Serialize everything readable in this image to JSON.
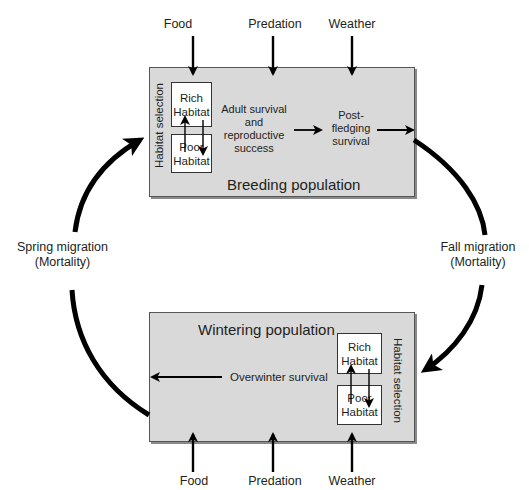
{
  "diagram": {
    "type": "annual-cycle flow diagram",
    "top_factors": [
      "Food",
      "Predation",
      "Weather"
    ],
    "bottom_factors": [
      "Food",
      "Predation",
      "Weather"
    ],
    "breeding": {
      "title": "Breeding population",
      "habitat_selection_label": "Habitat selection",
      "rich_habitat": [
        "Rich",
        "Habitat"
      ],
      "poor_habitat": [
        "Poor",
        "Habitat"
      ],
      "adult_survival": [
        "Adult survival",
        "and",
        "reproductive",
        "success"
      ],
      "post_fledging": [
        "Post-",
        "fledging",
        "survival"
      ]
    },
    "wintering": {
      "title": "Wintering population",
      "habitat_selection_label": "Habitat selection",
      "rich_habitat": [
        "Rich",
        "Habitat"
      ],
      "poor_habitat": [
        "Poor",
        "Habitat"
      ],
      "overwinter_survival": "Overwinter survival"
    },
    "spring_migration": [
      "Spring migration",
      "(Mortality)"
    ],
    "fall_migration": [
      "Fall migration",
      "(Mortality)"
    ],
    "colors": {
      "panel_fill": "#d9d9d9",
      "panel_border": "#555555",
      "arrow": "#000000",
      "text": "#231f20"
    }
  }
}
